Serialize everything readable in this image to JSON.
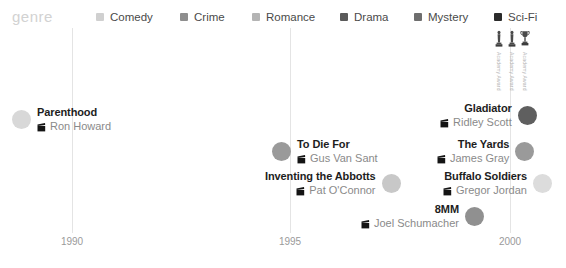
{
  "legend": {
    "title": "genre",
    "items": [
      {
        "label": "Comedy",
        "color": "#d0d0d0",
        "x": 96
      },
      {
        "label": "Crime",
        "color": "#8e8e8e",
        "x": 180
      },
      {
        "label": "Romance",
        "color": "#b4b4b4",
        "x": 252
      },
      {
        "label": "Drama",
        "color": "#5a5a5a",
        "x": 340
      },
      {
        "label": "Mystery",
        "color": "#6e6e6e",
        "x": 414
      },
      {
        "label": "Sci-Fi",
        "color": "#2b2b2b",
        "x": 494
      }
    ]
  },
  "awards": {
    "items": [
      {
        "icon": "oscar-statuette-icon",
        "label": "Academy Award"
      },
      {
        "icon": "oscar-statuette-icon",
        "label": "Academy Award"
      },
      {
        "icon": "trophy-cup-icon",
        "label": "Academy Award"
      }
    ]
  },
  "chart_data": {
    "type": "scatter",
    "title": "genre",
    "xlabel": "",
    "ylabel": "",
    "xlim": [
      1988,
      2001
    ],
    "grid": true,
    "legend_position": "top",
    "axis_ticks": [
      {
        "label": "1990",
        "x": 72
      },
      {
        "label": "1995",
        "x": 290
      },
      {
        "label": "2000",
        "x": 510
      }
    ],
    "categories": [
      "Comedy",
      "Crime",
      "Romance",
      "Drama",
      "Mystery",
      "Sci-Fi"
    ],
    "points": [
      {
        "title": "Parenthood",
        "director": "Ron Howard",
        "genre": "Comedy",
        "color": "#d8d8d8",
        "dot_size": 19,
        "align": "left-dot",
        "x": 12,
        "y": 106
      },
      {
        "title": "To Die For",
        "director": "Gus Van Sant",
        "genre": "Crime",
        "color": "#9a9a9a",
        "dot_size": 19,
        "align": "left-dot",
        "x": 272,
        "y": 138
      },
      {
        "title": "Inventing the Abbotts",
        "director": "Pat O'Connor",
        "genre": "Romance",
        "color": "#c8c8c8",
        "dot_size": 19,
        "align": "right-dot",
        "x": 265,
        "y": 170
      },
      {
        "title": "8MM",
        "director": "Joel Schumacher",
        "genre": "Mystery",
        "color": "#909090",
        "dot_size": 19,
        "align": "right-dot",
        "x": 361,
        "y": 203
      },
      {
        "title": "Gladiator",
        "director": "Ridley Scott",
        "genre": "Drama",
        "color": "#5f5f5f",
        "dot_size": 19,
        "align": "right-dot",
        "x": 440,
        "y": 102
      },
      {
        "title": "The Yards",
        "director": "James Gray",
        "genre": "Crime",
        "color": "#9a9a9a",
        "dot_size": 19,
        "align": "right-dot",
        "x": 437,
        "y": 138
      },
      {
        "title": "Buffalo Soldiers",
        "director": "Gregor Jordan",
        "genre": "Comedy",
        "color": "#dcdcdc",
        "dot_size": 19,
        "align": "right-dot",
        "x": 443,
        "y": 170
      }
    ]
  }
}
